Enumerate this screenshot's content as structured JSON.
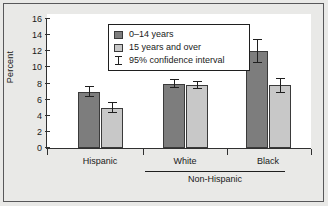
{
  "chart_data": {
    "type": "bar",
    "title": "",
    "xlabel": "",
    "ylabel": "Percent",
    "ylim": [
      0,
      16
    ],
    "yticks": [
      0,
      2,
      4,
      6,
      8,
      10,
      12,
      14,
      16
    ],
    "ytick_labels": [
      "0",
      "2",
      "4",
      "6",
      "8",
      "10",
      "12",
      "14",
      "16"
    ],
    "grid": false,
    "legend_position": "top-center",
    "categories": [
      "Hispanic",
      "White",
      "Black"
    ],
    "category_bracket": {
      "label": "Non-Hispanic",
      "covers": [
        "White",
        "Black"
      ]
    },
    "series": [
      {
        "name": "0–14 years",
        "color": "#7d7d7d",
        "values": [
          7.0,
          7.9,
          12.0
        ],
        "ci_low": [
          6.3,
          7.4,
          10.6
        ],
        "ci_high": [
          7.7,
          8.5,
          13.5
        ]
      },
      {
        "name": "15 years and over",
        "color": "#c8c8c8",
        "values": [
          5.0,
          7.8,
          7.8
        ],
        "ci_low": [
          4.3,
          7.3,
          6.8
        ],
        "ci_high": [
          5.7,
          8.3,
          8.7
        ]
      }
    ],
    "error_bar_label": "95% confidence interval"
  },
  "legend": {
    "entries": [
      {
        "label": "0–14 years",
        "swatch": "dark-gray-swatch"
      },
      {
        "label": "15 years and over",
        "swatch": "light-gray-swatch"
      },
      {
        "label": "95% confidence interval",
        "swatch": "error-bar-icon"
      }
    ]
  },
  "axis": {
    "y_title": "Percent",
    "tick_0": "0",
    "tick_2": "2",
    "tick_4": "4",
    "tick_6": "6",
    "tick_8": "8",
    "tick_10": "10",
    "tick_12": "12",
    "tick_14": "14",
    "tick_16": "16"
  },
  "groups": {
    "g0": "Hispanic",
    "g1": "White",
    "g2": "Black",
    "bracket": "Non-Hispanic"
  },
  "colors": {
    "series_dark": "#7d7d7d",
    "series_light": "#c8c8c8",
    "panel_bg": "#e9e9e7",
    "plot_bg": "#ffffff",
    "axis": "#303030"
  }
}
